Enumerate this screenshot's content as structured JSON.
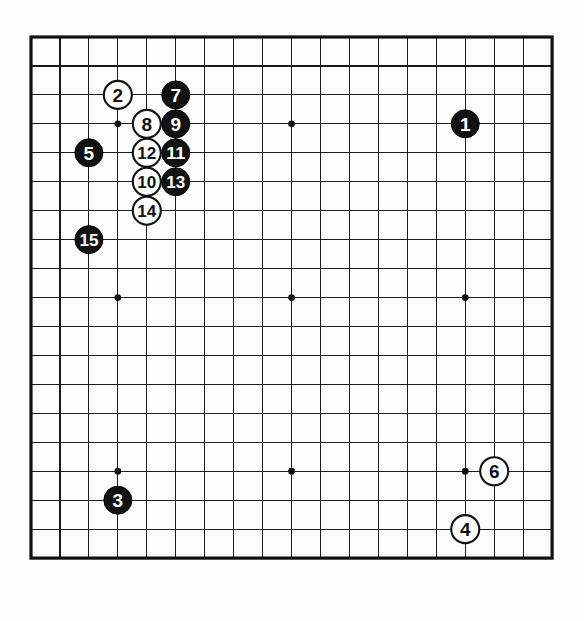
{
  "diagram": {
    "type": "go-board-diagram",
    "board_size": 19,
    "title": "",
    "colors": {
      "background": "#fcfcfc",
      "line": "#1a1a1a",
      "border": "#111111",
      "black_stone": "#111111",
      "white_stone": "#ffffff",
      "black_label": "#ffffff",
      "white_label": "#111111"
    },
    "geometry": {
      "origin_x": 31,
      "origin_y": 37,
      "spacing": 28.95,
      "stone_radius": 14,
      "star_radius": 3.4
    },
    "star_points": [
      {
        "col": 4,
        "row": 4
      },
      {
        "col": 10,
        "row": 4
      },
      {
        "col": 16,
        "row": 4
      },
      {
        "col": 4,
        "row": 10
      },
      {
        "col": 10,
        "row": 10
      },
      {
        "col": 16,
        "row": 10
      },
      {
        "col": 4,
        "row": 16
      },
      {
        "col": 10,
        "row": 16
      },
      {
        "col": 16,
        "row": 16
      }
    ],
    "moves": [
      {
        "number": "1",
        "color": "black",
        "col": 16,
        "row": 4
      },
      {
        "number": "2",
        "color": "white",
        "col": 4,
        "row": 3
      },
      {
        "number": "3",
        "color": "black",
        "col": 4,
        "row": 17
      },
      {
        "number": "4",
        "color": "white",
        "col": 16,
        "row": 18
      },
      {
        "number": "5",
        "color": "black",
        "col": 3,
        "row": 5
      },
      {
        "number": "6",
        "color": "white",
        "col": 17,
        "row": 16
      },
      {
        "number": "7",
        "color": "black",
        "col": 6,
        "row": 3
      },
      {
        "number": "8",
        "color": "white",
        "col": 5,
        "row": 4
      },
      {
        "number": "9",
        "color": "black",
        "col": 6,
        "row": 4
      },
      {
        "number": "10",
        "color": "white",
        "col": 5,
        "row": 6
      },
      {
        "number": "11",
        "color": "black",
        "col": 6,
        "row": 5
      },
      {
        "number": "12",
        "color": "white",
        "col": 5,
        "row": 5
      },
      {
        "number": "13",
        "color": "black",
        "col": 6,
        "row": 6
      },
      {
        "number": "14",
        "color": "white",
        "col": 5,
        "row": 7
      },
      {
        "number": "15",
        "color": "black",
        "col": 3,
        "row": 8
      }
    ]
  }
}
